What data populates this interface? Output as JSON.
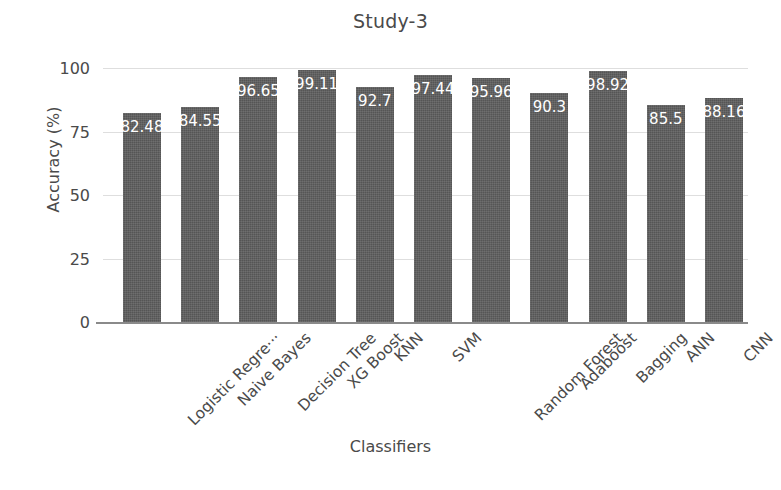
{
  "chart_data": {
    "type": "bar",
    "title": "Study-3",
    "xlabel": "Classifiers",
    "ylabel": "Accuracy (%)",
    "categories": [
      "Logistic Regre···",
      "Naive Bayes",
      "Decision Tree",
      "XG Boost",
      "KNN",
      "SVM",
      "Random Forest",
      "Adaboost",
      "Bagging",
      "ANN",
      "CNN"
    ],
    "values": [
      82.48,
      84.55,
      96.65,
      99.11,
      92.7,
      97.44,
      95.96,
      90.3,
      98.92,
      85.5,
      88.16
    ],
    "value_labels": [
      "82.48",
      "84.55",
      "96.65",
      "99.11",
      "92.7",
      "97.44",
      "95.96",
      "90.3",
      "98.92",
      "85.5",
      "88.16"
    ],
    "ylim": [
      0,
      100
    ],
    "yticks": [
      0,
      25,
      50,
      75,
      100
    ],
    "ytick_labels": [
      "0",
      "25",
      "50",
      "75",
      "100"
    ],
    "grid": true,
    "legend": "none",
    "bar_color": "#5e5e5e",
    "value_label_color": "#ffffff",
    "text_color": "#4a4a4a",
    "gridline_color": "#dedede",
    "background_color": "#ffffff"
  }
}
